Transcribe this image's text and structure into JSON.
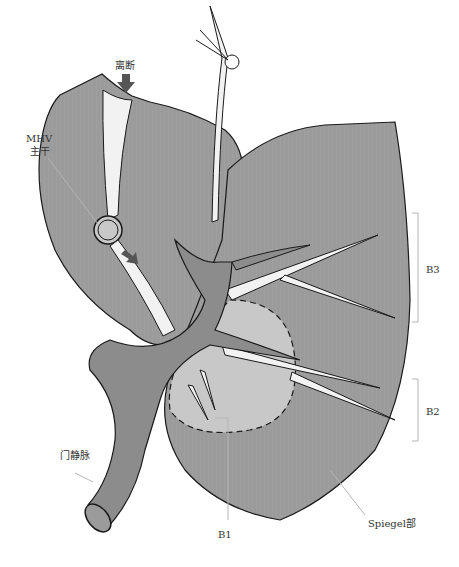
{
  "figure": {
    "type": "anatomical-illustration",
    "colors": {
      "liver": "#9b9b9b",
      "liver_dark": "#8c8c8c",
      "spiegel_region": "#c8c8c8",
      "vessel_light": "#f2f2f2",
      "outline": "#1a1a1a",
      "leader_line": "#b5b5b5",
      "arrow": "#555555"
    }
  },
  "labels": {
    "transection": "离断",
    "mhv_line1": "MHV",
    "mhv_line2": "主干",
    "b3": "B3",
    "b2": "B2",
    "portal_vein": "门静脉",
    "b1": "B1",
    "spiegel": "Spiegel部"
  }
}
